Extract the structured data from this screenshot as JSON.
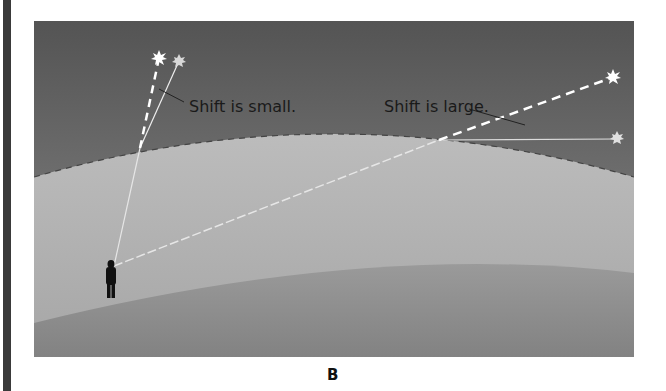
{
  "figure": {
    "panel_label": "B",
    "annotations": {
      "small_shift": "Shift is small.",
      "large_shift": "Shift is large."
    },
    "elements": {
      "observer": "silhouette of person standing on ground",
      "atmosphere_boundary": "dashed curved line",
      "stars": [
        "apparent star (near zenith)",
        "true star (near zenith)",
        "apparent star (near horizon)",
        "true star (near horizon)"
      ]
    },
    "colors": {
      "sky_top": "#555555",
      "sky_bottom": "#8a8a8a",
      "atmosphere": "#b0b0b0",
      "ground": "#8c8c8c",
      "text": "#1a1a1a",
      "frame_bar": "#3a3a3a"
    }
  }
}
